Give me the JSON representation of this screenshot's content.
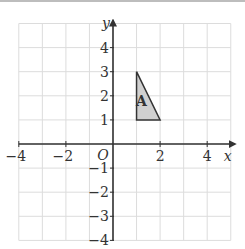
{
  "diagram": {
    "type": "coordinate-grid",
    "x_axis": {
      "label": "x",
      "min": -4,
      "max": 5,
      "tick_labels": [
        "-4",
        "-2",
        "2",
        "4"
      ]
    },
    "y_axis": {
      "label": "y",
      "min": -4,
      "max": 5,
      "tick_labels": [
        "4",
        "3",
        "2",
        "1",
        "-1",
        "-2",
        "-3",
        "-4"
      ]
    },
    "origin_label": "O",
    "shapes": [
      {
        "name": "A",
        "type": "triangle",
        "vertices": [
          [
            1,
            1
          ],
          [
            1,
            3
          ],
          [
            2,
            1
          ]
        ],
        "fill": "#d0d0d0",
        "stroke": "#333333"
      }
    ],
    "colors": {
      "grid": "#dcdcdc",
      "axis": "#333333"
    }
  }
}
